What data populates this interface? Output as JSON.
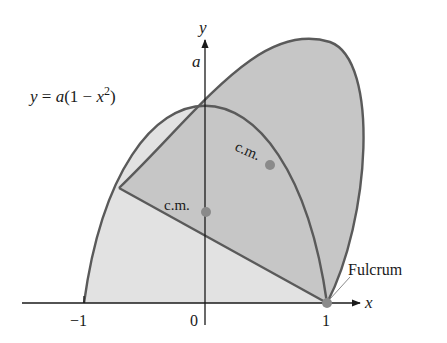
{
  "figure": {
    "equation_label": "y = a(1 − x²)",
    "equation_parts": {
      "y": "y",
      "eq": " = ",
      "a": "a",
      "rest": "(1 − ",
      "x": "x",
      "sup": "2",
      "close": ")"
    },
    "y_axis_label": "y",
    "x_axis_label": "x",
    "a_label": "a",
    "tick_labels": {
      "neg_one": "−1",
      "zero": "0",
      "one": "1"
    },
    "cm_label_upright": "c.m.",
    "cm_label_tilted": "c.m.",
    "fulcrum_label": "Fulcrum",
    "colors": {
      "light_fill": "#e2e2e2",
      "dark_fill": "#c4c4c4",
      "curve_stroke": "#5a5a5a",
      "axis": "#1a1a1a",
      "point": "#8a8a8a"
    }
  }
}
